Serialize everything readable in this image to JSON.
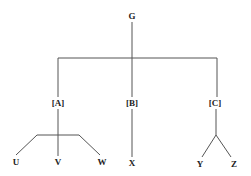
{
  "diagram": {
    "type": "tree",
    "root": {
      "id": "G",
      "label": "G"
    },
    "level1": [
      {
        "id": "A",
        "label": "[A]"
      },
      {
        "id": "B",
        "label": "[B]"
      },
      {
        "id": "C",
        "label": "[C]"
      }
    ],
    "leaves": {
      "A": [
        {
          "id": "U",
          "label": "U"
        },
        {
          "id": "V",
          "label": "V"
        },
        {
          "id": "W",
          "label": "W"
        }
      ],
      "B": [
        {
          "id": "X",
          "label": "X"
        }
      ],
      "C": [
        {
          "id": "Y",
          "label": "Y"
        },
        {
          "id": "Z",
          "label": "Z"
        }
      ]
    },
    "line_color": "#555555"
  }
}
